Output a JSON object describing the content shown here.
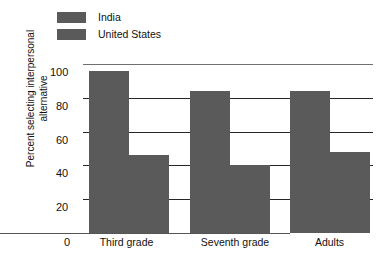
{
  "chart_data": {
    "type": "bar",
    "title": "",
    "xlabel": "",
    "ylabel_lines": [
      "Percent selecting interpersonal",
      "alternative"
    ],
    "ylabel": "Percent selecting interpersonal alternative",
    "categories": [
      "Third grade",
      "Seventh grade",
      "Adults"
    ],
    "series": [
      {
        "name": "India",
        "values": [
          96,
          84,
          84
        ],
        "color": "#5a5a5a"
      },
      {
        "name": "United States",
        "values": [
          46,
          40,
          48
        ],
        "color": "#5a5a5a"
      }
    ],
    "ylim": [
      0,
      100
    ],
    "yticks": [
      0,
      20,
      40,
      60,
      80,
      100
    ],
    "ytick_labels": [
      "0",
      "20",
      "40",
      "60",
      "80",
      "100"
    ],
    "grid": true,
    "legend_position": "top-left"
  },
  "legend": {
    "items": [
      {
        "label": "India"
      },
      {
        "label": "United States"
      }
    ]
  },
  "axis": {
    "origin_label": "0"
  }
}
